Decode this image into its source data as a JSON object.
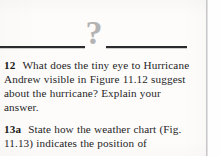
{
  "page": {
    "background_color": "#fdfcfb",
    "text_color": "#22211f"
  },
  "header": {
    "ornament_glyph": "?",
    "ornament_color": "#b3b3b3",
    "rule_color": "#2b2b2d"
  },
  "questions": [
    {
      "number": "12",
      "text": "What does the tiny eye to Hurricane Andrew visible in Figure 11.12 suggest about the hurricane? Explain your answer."
    },
    {
      "number": "13a",
      "text": "State how the weather chart (Fig. 11.13) indicates the position of"
    }
  ],
  "column_rule": {
    "color": "#c7c7c9"
  }
}
